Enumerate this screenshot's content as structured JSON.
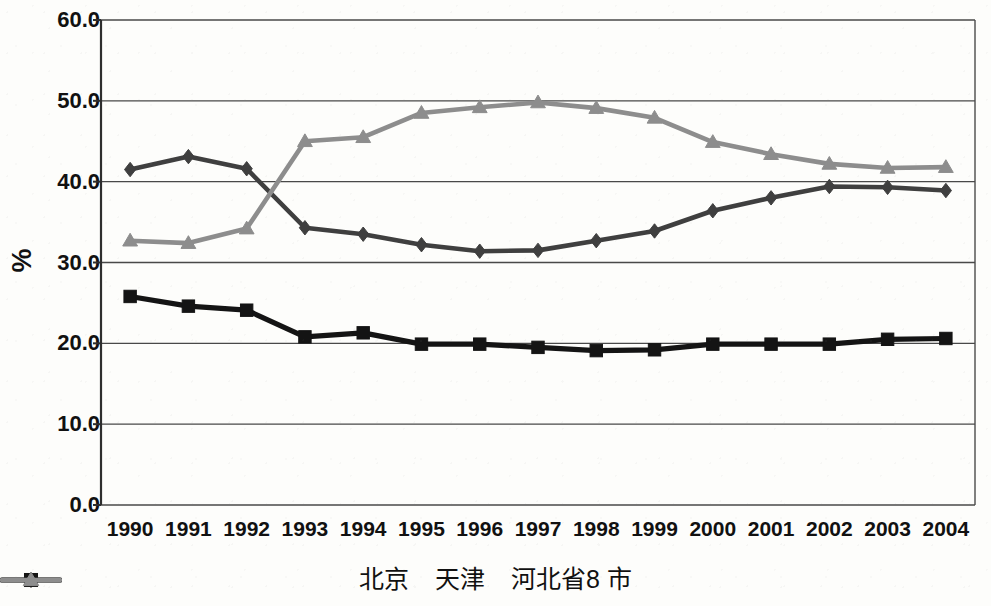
{
  "chart_data": {
    "type": "line",
    "title": "",
    "subtitle": "",
    "xlabel": "",
    "ylabel": "%",
    "categories": [
      "1990",
      "1991",
      "1992",
      "1993",
      "1994",
      "1995",
      "1996",
      "1997",
      "1998",
      "1999",
      "2000",
      "2001",
      "2002",
      "2003",
      "2004"
    ],
    "ylim": [
      0.0,
      60.0
    ],
    "ytick_labels": [
      "60.0",
      "50.0",
      "40.0",
      "30.0",
      "20.0",
      "10.0",
      "0.0"
    ],
    "ytick_values": [
      60.0,
      50.0,
      40.0,
      30.0,
      20.0,
      10.0,
      0.0
    ],
    "grid": "horizontal",
    "legend_position": "bottom",
    "series": [
      {
        "name": "北京",
        "marker": "diamond",
        "color": "#3f3f3f",
        "values": [
          41.5,
          43.1,
          41.6,
          34.3,
          33.5,
          32.2,
          31.4,
          31.5,
          32.7,
          33.9,
          36.4,
          38.0,
          39.4,
          39.3,
          38.9
        ]
      },
      {
        "name": "天津",
        "marker": "square",
        "color": "#141414",
        "values": [
          25.8,
          24.6,
          24.1,
          20.8,
          21.3,
          19.9,
          19.9,
          19.5,
          19.1,
          19.2,
          19.9,
          19.9,
          19.9,
          20.5,
          20.6
        ]
      },
      {
        "name": "河北省18市",
        "marker": "triangle",
        "color": "#8d8d8d",
        "values": [
          32.7,
          32.4,
          34.2,
          45.0,
          45.5,
          48.5,
          49.2,
          49.8,
          49.1,
          47.9,
          44.9,
          43.4,
          42.2,
          41.7,
          41.8
        ]
      }
    ]
  },
  "legend": {
    "items": [
      {
        "label": "北京",
        "marker": "diamond",
        "color": "#3f3f3f"
      },
      {
        "label": "天津",
        "marker": "square",
        "color": "#141414"
      },
      {
        "label": "河北省8 市",
        "marker": "triangle",
        "color": "#8d8d8d"
      }
    ]
  },
  "axis": {
    "y_title": "%"
  }
}
